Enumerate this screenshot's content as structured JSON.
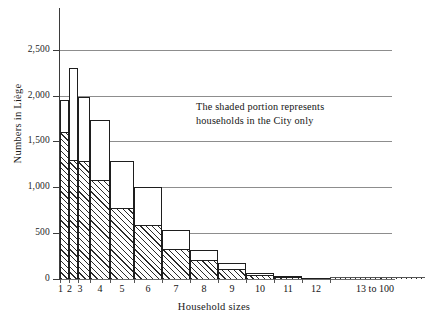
{
  "chart_data": {
    "type": "bar",
    "title": "",
    "xlabel": "Household sizes",
    "ylabel": "Numbers in Liège",
    "ylim": [
      0,
      2700
    ],
    "yticks": [
      0,
      500,
      1000,
      1500,
      2000,
      2500
    ],
    "ytick_labels": [
      "0",
      "500",
      "1,000",
      "1,500",
      "2,000",
      "2,500"
    ],
    "grid": "horizontal",
    "legend": "none",
    "categories": [
      "1",
      "2",
      "3",
      "4",
      "5",
      "6",
      "7",
      "8",
      "9",
      "10",
      "11",
      "12",
      "13 to 100"
    ],
    "series": [
      {
        "name": "Total households (outline)",
        "values": [
          1950,
          2300,
          1990,
          1740,
          1290,
          1000,
          540,
          320,
          175,
          70,
          30,
          15,
          5
        ]
      },
      {
        "name": "Households in the City only (shaded)",
        "values": [
          1600,
          1300,
          1290,
          1080,
          780,
          590,
          330,
          205,
          105,
          45,
          20,
          10,
          3
        ]
      }
    ],
    "annotations": [
      "The shaded portion represents\nhouseholds in the City only"
    ]
  },
  "axes": {
    "x_title": "Household sizes",
    "y_title": "Numbers in Liège",
    "y_tick_labels": [
      "2,500",
      "2,000",
      "1,500",
      "1,000",
      "500",
      "0"
    ],
    "x_tick_labels": [
      "1",
      "2",
      "3",
      "4",
      "5",
      "6",
      "7",
      "8",
      "9",
      "10",
      "11",
      "12",
      "13 to 100"
    ]
  },
  "annotation": {
    "line1": "The shaded portion represents",
    "line2": "households in the City only"
  },
  "colors": {
    "background": "#ffffff",
    "axis": "#3b3b3b",
    "grid": "#8d8d8d",
    "bar_outline": "#1e1e1e",
    "hatch": "#2b2b2b",
    "text": "#141414"
  }
}
